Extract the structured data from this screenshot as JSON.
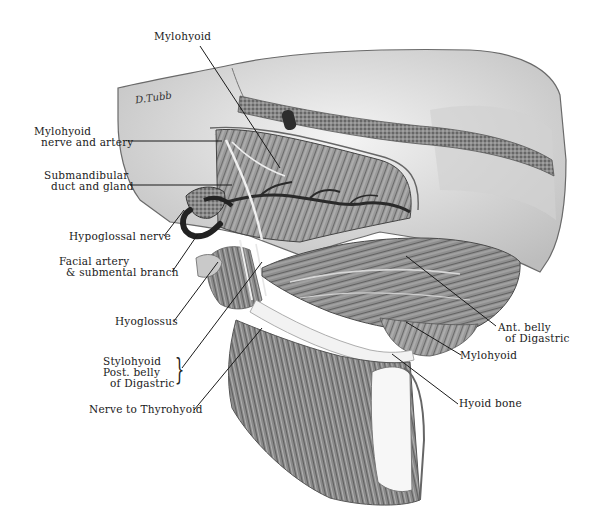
{
  "figure": {
    "type": "anatomical-illustration",
    "signature": "D.Tubb",
    "labels": [
      {
        "id": "mylohyoid-top",
        "text": "Mylohyoid"
      },
      {
        "id": "mylohyoid-nerve-artery",
        "text": "Mylohyoid\n  nerve and artery"
      },
      {
        "id": "submandibular-duct-gland",
        "text": "Submandibular\n  duct and gland"
      },
      {
        "id": "hypoglossal-nerve",
        "text": "Hypoglossal nerve"
      },
      {
        "id": "facial-artery",
        "text": "Facial artery\n  & submental branch"
      },
      {
        "id": "hyoglossus",
        "text": "Hyoglossus"
      },
      {
        "id": "stylohyoid-digastric",
        "text": "Stylohyoid\nPost. belly\n  of Digastric"
      },
      {
        "id": "nerve-thyrohyoid",
        "text": "Nerve to Thyrohyoid"
      },
      {
        "id": "ant-belly-digastric",
        "text": "Ant. belly\n  of Digastric"
      },
      {
        "id": "mylohyoid-right",
        "text": "Mylohyoid"
      },
      {
        "id": "hyoid-bone",
        "text": "Hyoid bone"
      }
    ]
  },
  "colors": {
    "background": "#ffffff",
    "ink": "#1a1a1a",
    "bone": "#e6e6e6",
    "muscle": "#8c8c8c",
    "vessel": "#3a3a3a"
  }
}
